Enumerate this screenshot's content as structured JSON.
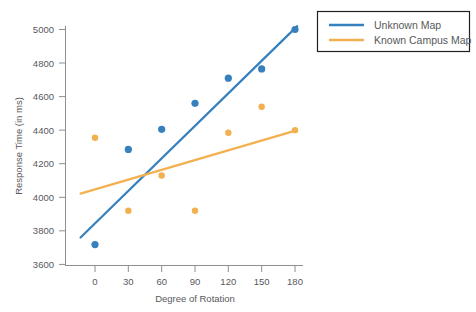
{
  "chart_data": {
    "type": "scatter",
    "title": "",
    "xlabel": "Degree of Rotation",
    "ylabel": "Response Time (in ms)",
    "xlim": [
      -15,
      195
    ],
    "ylim": [
      3600,
      5000
    ],
    "xticks": [
      0,
      30,
      60,
      90,
      120,
      150,
      180
    ],
    "yticks": [
      3600,
      3800,
      4000,
      4200,
      4400,
      4600,
      4800,
      5000
    ],
    "grid": false,
    "legend_position": "upper right outside",
    "x": [
      0,
      30,
      60,
      90,
      120,
      150,
      180
    ],
    "series": [
      {
        "name": "Unknown Map",
        "color": "#3580BD",
        "marker": "circle",
        "values": [
          3718,
          4285,
          4405,
          4560,
          4710,
          4765,
          5000
        ],
        "trendline": {
          "x": [
            -13,
            182
          ],
          "y": [
            3760,
            5020
          ],
          "color": "#3580BD"
        }
      },
      {
        "name": "Known Campus Map",
        "color": "#F2B051",
        "marker": "circle",
        "values": [
          4355,
          3920,
          4130,
          3920,
          4385,
          4540,
          4400
        ],
        "trendline": {
          "x": [
            -13,
            182
          ],
          "y": [
            4022,
            4400
          ],
          "color": "#F2B051"
        }
      }
    ]
  },
  "axes": {
    "ylabel": "Response Time (in ms)",
    "xlabel": "Degree of Rotation",
    "ytick_labels": [
      "5000",
      "4800",
      "4600",
      "4400",
      "4200",
      "4000",
      "3800",
      "3600"
    ],
    "xtick_labels": [
      "0",
      "30",
      "60",
      "90",
      "120",
      "150",
      "180"
    ]
  },
  "legend": {
    "items": [
      {
        "label": "Unknown Map",
        "color": "#3580BD"
      },
      {
        "label": "Known Campus Map",
        "color": "#F2B051"
      }
    ]
  }
}
